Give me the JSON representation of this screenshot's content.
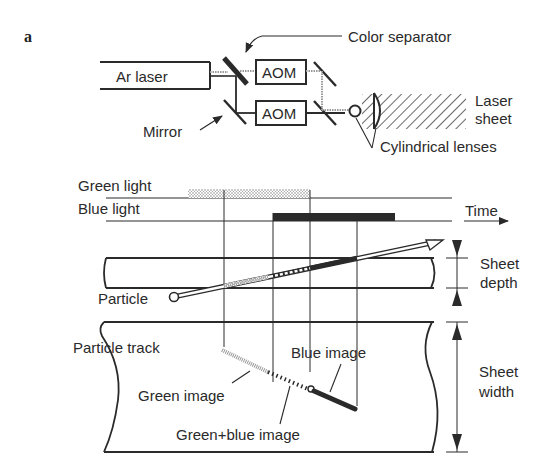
{
  "figure": {
    "panel_label": "a"
  },
  "setup": {
    "laser": "Ar laser",
    "modulators": [
      "AOM",
      "AOM"
    ],
    "color_separator": "Color separator",
    "mirror": "Mirror",
    "laser_sheet": [
      "Laser",
      "sheet"
    ],
    "lenses": "Cylindrical lenses"
  },
  "timing": {
    "green_light": "Green light",
    "blue_light": "Blue light",
    "time_axis": "Time"
  },
  "side_view": {
    "particle": "Particle",
    "sheet_depth": [
      "Sheet",
      "depth"
    ]
  },
  "top_view": {
    "particle_track": "Particle track",
    "green_image": "Green image",
    "blue_image": "Blue image",
    "green_blue_image": "Green+blue image",
    "sheet_width": [
      "Sheet",
      "width"
    ]
  },
  "colors": {
    "ink": "#2a2a2a",
    "stipple": "#9a9a9a",
    "background": "#ffffff"
  }
}
